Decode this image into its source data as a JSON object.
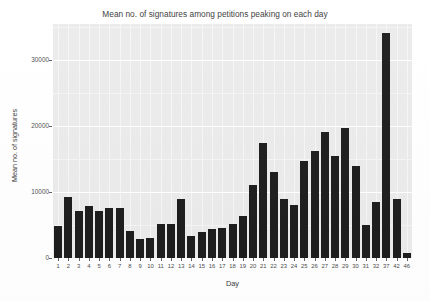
{
  "chart_data": {
    "type": "bar",
    "title": "Mean no. of signatures among petitions peaking on each day",
    "xlabel": "Day",
    "ylabel": "Mean no. of signatures",
    "ylim": [
      0,
      35500
    ],
    "y_ticks": [
      0,
      10000,
      20000,
      30000
    ],
    "y_tick_labels": [
      "0",
      "10000",
      "20000",
      "30000"
    ],
    "grid": true,
    "legend": false,
    "bar_color": "#1c1c1c",
    "panel_color": "#ebebeb",
    "categories": [
      "1",
      "2",
      "3",
      "4",
      "5",
      "6",
      "7",
      "8",
      "9",
      "10",
      "11",
      "12",
      "13",
      "14",
      "15",
      "16",
      "17",
      "18",
      "19",
      "20",
      "21",
      "22",
      "23",
      "24",
      "25",
      "26",
      "27",
      "28",
      "29",
      "30",
      "31",
      "32",
      "37",
      "42",
      "46"
    ],
    "values": [
      4800,
      9200,
      7200,
      7900,
      7200,
      7600,
      7600,
      4100,
      2900,
      3000,
      5200,
      5100,
      8900,
      3300,
      3900,
      4400,
      4500,
      5200,
      6400,
      11100,
      17500,
      13000,
      9000,
      8000,
      14700,
      16300,
      19100,
      15500,
      19800,
      14000,
      5000,
      8500,
      34200,
      8900,
      700
    ]
  }
}
